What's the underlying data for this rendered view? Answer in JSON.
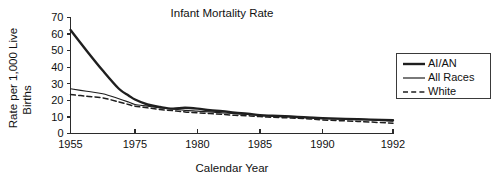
{
  "chart_data": {
    "type": "line",
    "title": "Infant Mortality Rate",
    "xlabel": "Calendar Year",
    "ylabel": "Rate per 1,000 Live Births",
    "ylabel_line1": "Rate per 1,000 Live",
    "ylabel_line2": "Births",
    "ylim": [
      0,
      70
    ],
    "xlim": [
      1955,
      1992
    ],
    "grid": false,
    "legend_position": "right",
    "y_ticks": [
      0,
      10,
      20,
      30,
      40,
      50,
      60,
      70
    ],
    "y_tick_labels": [
      "0",
      "10",
      "20",
      "30",
      "40",
      "50",
      "60",
      "70"
    ],
    "x_ticks": [
      1955,
      1975,
      1980,
      1985,
      1990,
      1992
    ],
    "x_tick_labels": [
      "1955",
      "1975",
      "1980",
      "1985",
      "1990",
      "1992"
    ],
    "x_axis_scale_note": "non-uniform: 1955-1975 compressed",
    "x_tick_positions_px": [
      70.5,
      135,
      197.5,
      260,
      322.5,
      393
    ],
    "series": [
      {
        "name": "AI/AN",
        "style": "solid-thick",
        "x": [
          1955,
          1960,
          1965,
          1970,
          1973,
          1975,
          1976,
          1977,
          1978,
          1979,
          1980,
          1981,
          1982,
          1983,
          1984,
          1985,
          1986,
          1987,
          1988,
          1989,
          1990,
          1991,
          1992
        ],
        "values": [
          62.5,
          50.0,
          38.0,
          27.0,
          23.0,
          20.5,
          17.5,
          16.0,
          15.0,
          15.5,
          15.0,
          14.0,
          13.5,
          12.5,
          12.0,
          11.0,
          10.7,
          10.4,
          10.0,
          9.6,
          9.2,
          8.6,
          8.0
        ]
      },
      {
        "name": "All Races",
        "style": "solid-thin",
        "x": [
          1955,
          1960,
          1965,
          1970,
          1973,
          1975,
          1976,
          1977,
          1978,
          1979,
          1980,
          1981,
          1982,
          1983,
          1984,
          1985,
          1986,
          1987,
          1988,
          1989,
          1990,
          1991,
          1992
        ],
        "values": [
          27.0,
          25.5,
          24.0,
          21.0,
          19.0,
          17.5,
          16.5,
          15.5,
          14.8,
          14.0,
          13.5,
          13.0,
          12.5,
          12.0,
          11.5,
          11.0,
          10.6,
          10.3,
          10.0,
          9.7,
          9.2,
          8.7,
          7.5
        ]
      },
      {
        "name": "White",
        "style": "dashed",
        "x": [
          1955,
          1960,
          1965,
          1970,
          1973,
          1975,
          1976,
          1977,
          1978,
          1979,
          1980,
          1981,
          1982,
          1983,
          1984,
          1985,
          1986,
          1987,
          1988,
          1989,
          1990,
          1991,
          1992
        ],
        "values": [
          23.5,
          22.5,
          21.5,
          19.0,
          17.5,
          16.5,
          15.5,
          14.5,
          13.8,
          13.0,
          12.5,
          12.0,
          11.5,
          11.0,
          10.7,
          10.2,
          9.8,
          9.5,
          9.2,
          8.8,
          8.2,
          7.3,
          6.2
        ]
      }
    ]
  },
  "legend": {
    "items": [
      {
        "label": "AI/AN",
        "style": "solid-thick"
      },
      {
        "label": "All Races",
        "style": "solid-thin"
      },
      {
        "label": "White",
        "style": "dashed"
      }
    ]
  },
  "colors": {
    "background": "#ffffff",
    "ink": "#1f1f1f",
    "axis": "#2b2b2b"
  }
}
